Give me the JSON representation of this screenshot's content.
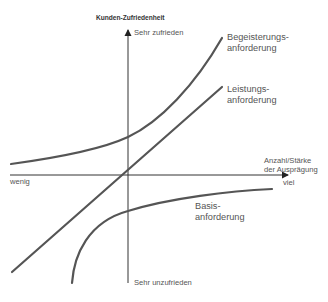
{
  "diagram": {
    "y_axis": {
      "label": "Kunden-Zufriedenheit",
      "top_label": "Sehr zufrieden",
      "bottom_label": "Sehr unzufrieden"
    },
    "x_axis": {
      "label_line1": "Anzahl/Stärke",
      "label_line2": "der Ausprägung",
      "left_label": "wenig",
      "right_label": "viel"
    },
    "curves": [
      {
        "id": "begeisterung",
        "label_line1": "Begeisterungs-",
        "label_line2": "anforderung",
        "shape": "exponential-rising"
      },
      {
        "id": "leistung",
        "label_line1": "Leistungs-",
        "label_line2": "anforderung",
        "shape": "linear"
      },
      {
        "id": "basis",
        "label_line1": "Basis-",
        "label_line2": "anforderung",
        "shape": "logarithmic-saturating"
      }
    ],
    "colors": {
      "curve": "#555555",
      "axis": "#333333",
      "text": "#555555"
    }
  }
}
